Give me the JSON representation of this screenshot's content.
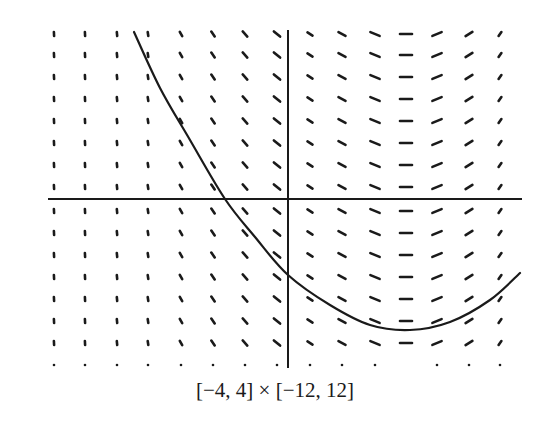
{
  "chart_data": {
    "type": "slope_field",
    "title": "",
    "caption": "[−4, 4] × [−12, 12]",
    "xlim": [
      -4,
      4
    ],
    "ylim": [
      -12,
      12
    ],
    "grid": false,
    "legend": null,
    "field": {
      "columns_px": [
        54,
        85,
        117,
        148,
        181,
        213,
        245,
        277,
        310,
        342,
        375,
        406,
        437,
        469,
        500
      ],
      "rows_px": [
        34,
        55,
        77,
        99,
        121,
        143,
        165,
        187,
        211,
        233,
        255,
        277,
        299,
        321,
        343,
        365
      ],
      "column_angles_deg": [
        88,
        86,
        84,
        80,
        62,
        55,
        48,
        40,
        32,
        28,
        22,
        0,
        -22,
        -32,
        -55
      ],
      "column_lengths_px": [
        4,
        4,
        4,
        4,
        5,
        6,
        7,
        8,
        6,
        8,
        10,
        12,
        10,
        8,
        5
      ],
      "bottom_row_dots_only": true,
      "bottom_row_missing_columns": [
        11
      ]
    },
    "axes": {
      "x_axis": {
        "y_px": 199,
        "x_from_px": 48,
        "x_to_px": 522
      },
      "y_axis": {
        "x_px": 288,
        "y_from_px": 30,
        "y_to_px": 368
      }
    },
    "solution_curve": {
      "description": "solution curve, decreasing then reaching minimum and rising",
      "points_px": [
        [
          134,
          32
        ],
        [
          160,
          88
        ],
        [
          190,
          140
        ],
        [
          225,
          199
        ],
        [
          255,
          237
        ],
        [
          288,
          275
        ],
        [
          330,
          305
        ],
        [
          370,
          325
        ],
        [
          410,
          330
        ],
        [
          450,
          322
        ],
        [
          490,
          300
        ],
        [
          520,
          273
        ]
      ]
    },
    "colors": {
      "ink": "#1a1a1a",
      "background": "#ffffff"
    }
  }
}
